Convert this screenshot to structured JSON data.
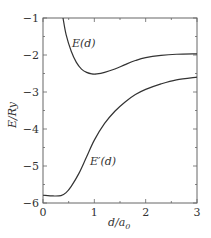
{
  "chart_data": {
    "type": "line",
    "title": "",
    "xlabel": "d/a_0",
    "ylabel": "E/Ry",
    "xlim": [
      0,
      3
    ],
    "ylim": [
      -6,
      -1
    ],
    "xticks": [
      "0",
      "1",
      "2",
      "3"
    ],
    "yticks": [
      "-1",
      "-2",
      "-3",
      "-4",
      "-5",
      "-6"
    ],
    "grid": false,
    "legend": null,
    "series": [
      {
        "name": "E(d)",
        "x": [
          0.39,
          0.45,
          0.55,
          0.65,
          0.75,
          0.85,
          0.95,
          1.05,
          1.2,
          1.4,
          1.6,
          1.8,
          2.0,
          2.3,
          2.6,
          3.0
        ],
        "y": [
          -1.0,
          -1.45,
          -1.9,
          -2.2,
          -2.38,
          -2.47,
          -2.51,
          -2.51,
          -2.47,
          -2.38,
          -2.26,
          -2.15,
          -2.07,
          -2.01,
          -1.98,
          -1.97
        ]
      },
      {
        "name": "E'(d)",
        "x": [
          0.0,
          0.2,
          0.35,
          0.45,
          0.55,
          0.7,
          0.85,
          1.0,
          1.2,
          1.4,
          1.6,
          1.8,
          2.0,
          2.3,
          2.6,
          3.0
        ],
        "y": [
          -5.79,
          -5.81,
          -5.8,
          -5.72,
          -5.55,
          -5.2,
          -4.75,
          -4.3,
          -3.85,
          -3.52,
          -3.27,
          -3.07,
          -2.93,
          -2.78,
          -2.67,
          -2.6
        ]
      }
    ],
    "annotations": [
      {
        "text": "E(d)",
        "x": 0.6,
        "y": -1.7
      },
      {
        "text": "E'(d)",
        "x": 0.95,
        "y": -5.0
      }
    ]
  },
  "labels": {
    "xlabel": "d/a",
    "xlabel_sub": "0",
    "ylabel": "E/Ry",
    "curve1": "E(d)",
    "curve2": "E′(d)"
  },
  "ticks": {
    "x": [
      "0",
      "1",
      "2",
      "3"
    ],
    "y": [
      "−1",
      "−2",
      "−3",
      "−4",
      "−5",
      "−6"
    ]
  }
}
